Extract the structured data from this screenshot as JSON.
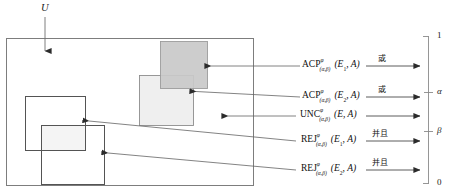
{
  "figure": {
    "universe_label": "U",
    "outer_box": {
      "name": "universe-rectangle"
    },
    "regions": [
      {
        "id": "e1-upper",
        "name": "dark-shaded-square",
        "fill": "#c9c9c9",
        "stroke": "#9a9a9a"
      },
      {
        "id": "e2-upper",
        "name": "light-shaded-square",
        "fill": "#eeeeee",
        "stroke": "#8a8a8a"
      },
      {
        "id": "e1-lower",
        "name": "upper-left-open-square",
        "fill": "none",
        "stroke": "#555555"
      },
      {
        "id": "e2-lower",
        "name": "lower-left-open-square",
        "fill": "none",
        "stroke": "#555555"
      }
    ],
    "annotations": [
      {
        "id": "acp-e1",
        "operator": "ACP",
        "superscript": "φ",
        "subscript": "(α,β)",
        "argument": "(E",
        "arg_index": "1",
        "arg_tail": ", A)",
        "connector": "或",
        "target_region": "e1-upper"
      },
      {
        "id": "acp-e2",
        "operator": "ACP",
        "superscript": "φ",
        "subscript": "(α,β)",
        "argument": "(E",
        "arg_index": "2",
        "arg_tail": ", A)",
        "connector": "或",
        "target_region": "e2-upper"
      },
      {
        "id": "unc-e",
        "operator": "UNC",
        "superscript": "φ",
        "subscript": "(α,β)",
        "argument": "(E",
        "arg_index": "",
        "arg_tail": ", A)",
        "connector": "",
        "target_region": "boundary"
      },
      {
        "id": "rej-e1",
        "operator": "REJ",
        "superscript": "φ",
        "subscript": "(α,β)",
        "argument": "(E",
        "arg_index": "1",
        "arg_tail": ", A)",
        "connector": "并且",
        "target_region": "e1-lower"
      },
      {
        "id": "rej-e2",
        "operator": "REJ",
        "superscript": "φ",
        "subscript": "(α,β)",
        "argument": "(E",
        "arg_index": "2",
        "arg_tail": ", A)",
        "connector": "并且",
        "target_region": "e2-lower"
      }
    ],
    "axis": {
      "name": "probability-scale",
      "ticks": [
        {
          "value": "1",
          "position_pct": 100
        },
        {
          "value": "α",
          "position_pct": 62
        },
        {
          "value": "β",
          "position_pct": 36
        },
        {
          "value": "0",
          "position_pct": 0
        }
      ]
    }
  }
}
